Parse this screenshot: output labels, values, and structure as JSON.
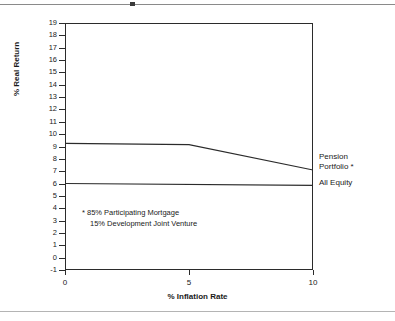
{
  "chart_data": {
    "type": "line",
    "title": "",
    "subtitle": "",
    "xlabel": "% Inflation Rate",
    "ylabel": "% Real Return",
    "xlim": [
      0,
      10
    ],
    "ylim": [
      -1,
      19
    ],
    "xticks": [
      0,
      5,
      10
    ],
    "xtick_labels": [
      "0",
      "5",
      "10"
    ],
    "yticks": [
      -1,
      0,
      1,
      2,
      3,
      4,
      5,
      6,
      7,
      8,
      9,
      10,
      11,
      12,
      13,
      14,
      15,
      16,
      17,
      18,
      19
    ],
    "ytick_labels": [
      "-1",
      "0",
      "1",
      "2",
      "3",
      "4",
      "5",
      "6",
      "7",
      "8",
      "9",
      "10",
      "11",
      "12",
      "13",
      "14",
      "15",
      "16",
      "17",
      "18",
      "19"
    ],
    "grid": false,
    "legend_position": "right-of-axes",
    "series": [
      {
        "name": "Pension Portfolio *",
        "x": [
          0,
          5,
          10
        ],
        "values": [
          9.25,
          9.15,
          7.1
        ],
        "color": "#2b2b2b"
      },
      {
        "name": "All Equity",
        "x": [
          0,
          10
        ],
        "values": [
          6.0,
          5.85
        ],
        "color": "#2b2b2b"
      }
    ],
    "annotations": [
      "* 85%  Participating Mortgage",
      "15%  Development Joint Venture"
    ]
  },
  "axes": {
    "xlabel": "% Inflation Rate",
    "ylabel": "% Real Return"
  },
  "labels": {
    "pension_line1": "Pension",
    "pension_line2": "Portfolio *",
    "all_equity": "All Equity"
  },
  "annotation": {
    "line1": "* 85%  Participating Mortgage",
    "line2": "15%  Development Joint Venture"
  },
  "colors": {
    "line": "#2b2b2b",
    "axis": "#2b2b2b",
    "rule": "#8a8a8a",
    "text": "#1a1a1a",
    "background": "#ffffff"
  }
}
